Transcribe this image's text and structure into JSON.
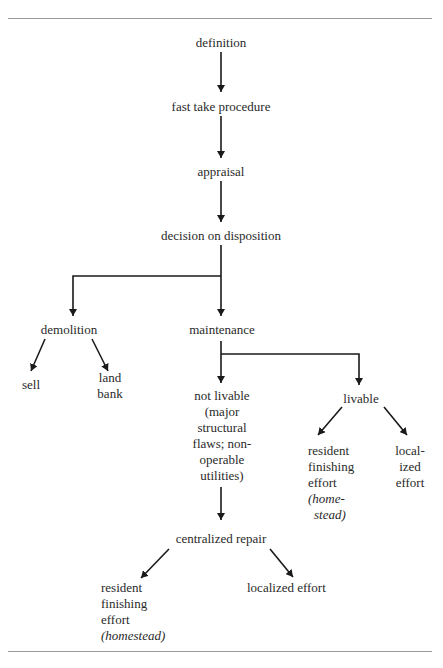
{
  "header": {
    "clipped_text": "",
    "rule_color": "#9a9a9a"
  },
  "nodes": {
    "definition": "definition",
    "fast_take": "fast take procedure",
    "appraisal": "appraisal",
    "decision": "decision on disposition",
    "demolition": "demolition",
    "sell": "sell",
    "land_bank": [
      "land",
      "bank"
    ],
    "maintenance": "maintenance",
    "not_livable": [
      "not livable",
      "(major",
      "structural",
      "flaws; non-",
      "operable",
      "utilities)"
    ],
    "livable": "livable",
    "livable_resident": [
      "resident",
      "finishing",
      "effort"
    ],
    "livable_resident_italic": [
      "(home-",
      "stead)"
    ],
    "livable_localized": [
      "local-",
      "ized",
      "effort"
    ],
    "centralized_repair": "centralized repair",
    "central_resident": [
      "resident",
      "finishing",
      "effort"
    ],
    "central_resident_italic": "(homestead)",
    "central_localized": "localized effort"
  },
  "colors": {
    "line": "#1a1a1a",
    "text": "#2a2a2a"
  }
}
